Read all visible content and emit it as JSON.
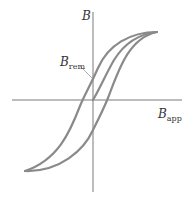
{
  "diagram": {
    "type": "hysteresis-curve",
    "colors": {
      "curve": "#8a8a8a",
      "axis": "#7a7a7a",
      "text": "#333333",
      "background": "#ffffff"
    },
    "axes": {
      "y_label_main": "B",
      "x_label_main": "B",
      "x_label_sub": "app"
    },
    "annotations": [
      {
        "id": "remanence",
        "main": "B",
        "sub": "rem"
      }
    ],
    "curves": [
      {
        "id": "initial-magnetization",
        "description": "Virgin curve from origin to saturation"
      },
      {
        "id": "hysteresis-loop",
        "description": "Outer loop between positive and negative saturation"
      }
    ]
  }
}
